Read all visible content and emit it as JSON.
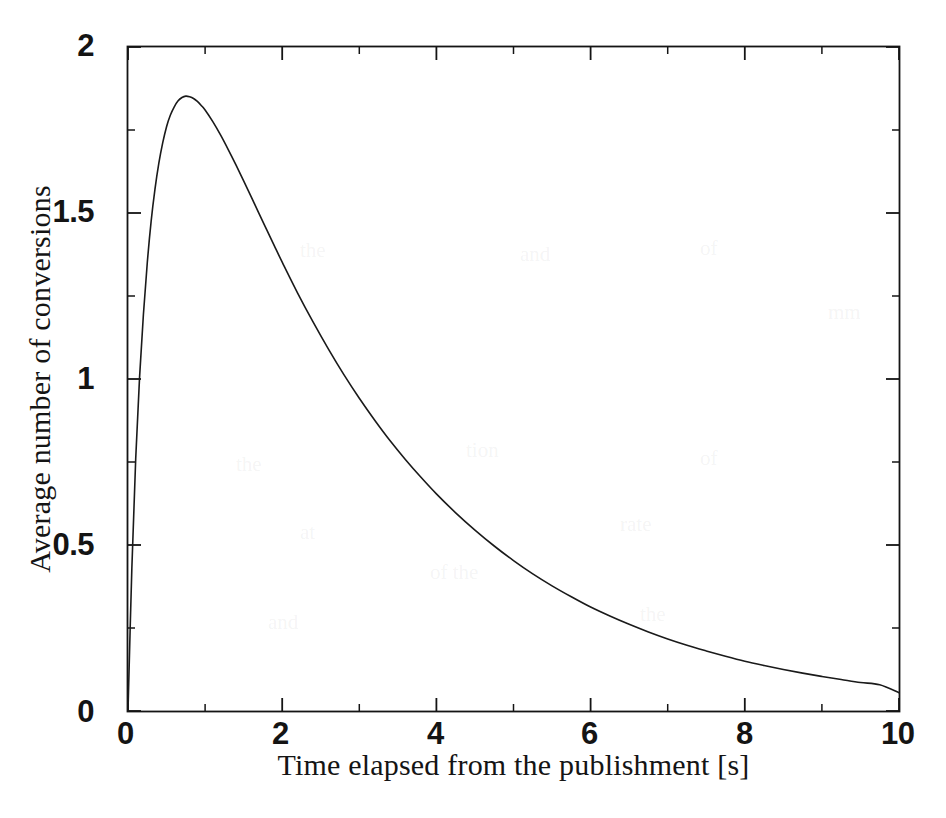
{
  "figure": {
    "background_color": "#ffffff",
    "line_color": "#1a1a1a",
    "axis_color": "#141414"
  },
  "axes": {
    "x_title": "Time elapsed from the publishment [s]",
    "y_title": "Average number of conversions",
    "x_tick_labels": [
      "0",
      "2",
      "4",
      "6",
      "8",
      "10"
    ],
    "y_tick_labels": [
      "0",
      "0.5",
      "1",
      "1.5",
      "2"
    ]
  },
  "chart_data": {
    "type": "line",
    "title": "",
    "xlabel": "Time elapsed from the publishment [s]",
    "ylabel": "Average number of conversions",
    "xlim": [
      0,
      10
    ],
    "ylim": [
      0,
      2
    ],
    "x_major_ticks": [
      0,
      2,
      4,
      6,
      8,
      10
    ],
    "x_minor_ticks": [
      1,
      3,
      5,
      7,
      9
    ],
    "y_major_ticks": [
      0,
      0.5,
      1,
      1.5,
      2
    ],
    "y_minor_ticks": [
      0.25,
      0.75,
      1.25,
      1.75
    ],
    "grid": false,
    "legend": null,
    "legend_position": null,
    "annotations": [],
    "series": [
      {
        "name": "Average number of conversions",
        "color": "#1a1a1a",
        "line_width": 1.6,
        "peak": {
          "x": 0.75,
          "y": 1.85
        },
        "x": [
          0.0,
          0.05,
          0.1,
          0.15,
          0.2,
          0.25,
          0.3,
          0.35,
          0.4,
          0.45,
          0.5,
          0.55,
          0.6,
          0.65,
          0.7,
          0.75,
          0.8,
          0.85,
          0.9,
          0.95,
          1.0,
          1.1,
          1.2,
          1.3,
          1.4,
          1.5,
          1.6,
          1.7,
          1.8,
          1.9,
          2.0,
          2.2,
          2.4,
          2.6,
          2.8,
          3.0,
          3.2,
          3.4,
          3.6,
          3.8,
          4.0,
          4.25,
          4.5,
          4.75,
          5.0,
          5.25,
          5.5,
          5.75,
          6.0,
          6.25,
          6.5,
          6.75,
          7.0,
          7.25,
          7.5,
          7.75,
          8.0,
          8.25,
          8.5,
          8.75,
          9.0,
          9.25,
          9.5,
          9.75,
          10.0
        ],
        "y": [
          0.0,
          0.43,
          0.76,
          1.005,
          1.195,
          1.35,
          1.475,
          1.572,
          1.65,
          1.711,
          1.76,
          1.795,
          1.82,
          1.838,
          1.848,
          1.852,
          1.85,
          1.845,
          1.836,
          1.824,
          1.81,
          1.775,
          1.735,
          1.691,
          1.645,
          1.597,
          1.548,
          1.498,
          1.449,
          1.4,
          1.352,
          1.259,
          1.172,
          1.09,
          1.013,
          0.942,
          0.876,
          0.814,
          0.757,
          0.704,
          0.654,
          0.597,
          0.545,
          0.497,
          0.453,
          0.413,
          0.377,
          0.344,
          0.313,
          0.286,
          0.261,
          0.238,
          0.217,
          0.198,
          0.181,
          0.165,
          0.15,
          0.137,
          0.125,
          0.114,
          0.104,
          0.095,
          0.086,
          0.079,
          0.055
        ]
      }
    ]
  },
  "ghost_text": [
    {
      "text": "the",
      "x": 300,
      "y": 238
    },
    {
      "text": "and",
      "x": 520,
      "y": 242
    },
    {
      "text": "of",
      "x": 700,
      "y": 236
    },
    {
      "text": "mm",
      "x": 828,
      "y": 300
    },
    {
      "text": "the",
      "x": 236,
      "y": 452
    },
    {
      "text": "tion",
      "x": 466,
      "y": 438
    },
    {
      "text": "of",
      "x": 700,
      "y": 446
    },
    {
      "text": "at",
      "x": 300,
      "y": 520
    },
    {
      "text": "rate",
      "x": 620,
      "y": 512
    },
    {
      "text": "of the",
      "x": 430,
      "y": 560
    },
    {
      "text": "and",
      "x": 268,
      "y": 610
    },
    {
      "text": "the",
      "x": 640,
      "y": 602
    }
  ]
}
